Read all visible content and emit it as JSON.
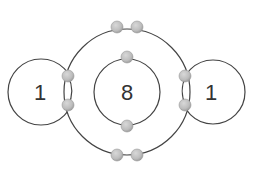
{
  "diagram": {
    "atoms": [
      {
        "id": "hydrogen-left",
        "label": "1",
        "cx": 41,
        "cy": 92,
        "r": 33
      },
      {
        "id": "oxygen",
        "label": "8",
        "cx": 127,
        "cy": 92,
        "inner_r": 33,
        "outer_r": 63
      },
      {
        "id": "hydrogen-right",
        "label": "1",
        "cx": 213,
        "cy": 92,
        "r": 32
      }
    ],
    "labels": {
      "hydrogen_left": "1",
      "oxygen": "8",
      "hydrogen_right": "1"
    },
    "electron_counts": {
      "oxygen_inner_shell": 2,
      "oxygen_outer_lone_pairs": 4,
      "shared_pairs": 4
    },
    "colors": {
      "stroke": "#444444",
      "electron_fill": "#bdbdbd",
      "electron_edge": "#999999",
      "label": "#333333",
      "background": "#ffffff"
    }
  }
}
